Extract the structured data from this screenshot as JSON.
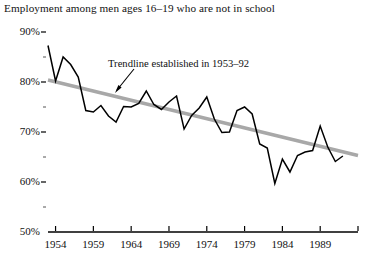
{
  "chart_data": {
    "type": "line",
    "title": "Employment among men ages 16–19 who are not in school",
    "xlabel": "",
    "ylabel": "",
    "xlim": [
      1953,
      1994
    ],
    "ylim": [
      50,
      90
    ],
    "grid": false,
    "legend": "none",
    "y_tick_labels": [
      "90%",
      "80%",
      "70%",
      "60%",
      "50%"
    ],
    "y_ticks": [
      90,
      80,
      70,
      60,
      50
    ],
    "y_minor_ticks": [
      85,
      75,
      65,
      55
    ],
    "x_tick_labels": [
      "1954",
      "1959",
      "1964",
      "1969",
      "1974",
      "1979",
      "1984",
      "1989"
    ],
    "x_ticks": [
      1954,
      1959,
      1964,
      1969,
      1974,
      1979,
      1984,
      1989
    ],
    "x_extra_ticks": [
      1994
    ],
    "annotations": [
      {
        "text": "Trendline established in 1953–92",
        "points_to": "trendline"
      }
    ],
    "series": [
      {
        "name": "Employment rate",
        "color": "#000000",
        "x": [
          1953,
          1954,
          1955,
          1956,
          1957,
          1958,
          1959,
          1960,
          1961,
          1962,
          1963,
          1964,
          1965,
          1966,
          1967,
          1968,
          1969,
          1970,
          1971,
          1972,
          1973,
          1974,
          1975,
          1976,
          1977,
          1978,
          1979,
          1980,
          1981,
          1982,
          1983,
          1984,
          1985,
          1986,
          1987,
          1988,
          1989,
          1990,
          1991,
          1992
        ],
        "values": [
          87.3,
          80.2,
          85.0,
          83.5,
          81.0,
          74.3,
          74.0,
          75.3,
          73.2,
          72.0,
          75.1,
          75.0,
          75.7,
          78.2,
          75.5,
          74.5,
          76.0,
          77.2,
          70.6,
          73.3,
          74.8,
          77.0,
          72.6,
          69.9,
          70.0,
          74.3,
          75.0,
          73.6,
          67.6,
          66.8,
          59.7,
          64.6,
          62.0,
          65.3,
          66.0,
          66.3,
          71.2,
          67.0,
          64.1,
          65.2
        ]
      },
      {
        "name": "Trendline established in 1953–92",
        "color": "#a8a8a8",
        "x": [
          1953,
          1994
        ],
        "values": [
          80.4,
          65.3
        ]
      }
    ]
  }
}
